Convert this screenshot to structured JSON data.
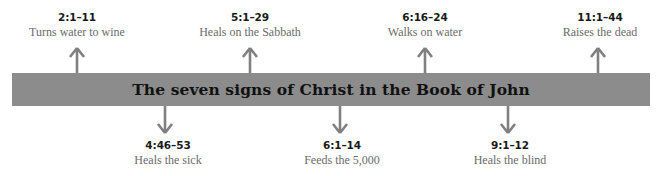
{
  "banner": {
    "title": "The seven signs of Christ in the Book of John",
    "fill_color": "#8c8c8c",
    "text_color": "#111111"
  },
  "arrow_color": "#808080",
  "signs_above": [
    {
      "ref": "2:1–11",
      "desc": "Turns water to wine",
      "x": 77,
      "arrow_x": 77
    },
    {
      "ref": "5:1–29",
      "desc": "Heals on the Sabbath",
      "x": 250,
      "arrow_x": 250
    },
    {
      "ref": "6:16–24",
      "desc": "Walks on water",
      "x": 425,
      "arrow_x": 425
    },
    {
      "ref": "11:1–44",
      "desc": "Raises the dead",
      "x": 600,
      "arrow_x": 598
    }
  ],
  "signs_below": [
    {
      "ref": "4:46–53",
      "desc": "Heals the sick",
      "x": 168,
      "arrow_x": 165
    },
    {
      "ref": "6:1–14",
      "desc": "Feeds the 5,000",
      "x": 342,
      "arrow_x": 340
    },
    {
      "ref": "9:1–12",
      "desc": "Heals the blind",
      "x": 510,
      "arrow_x": 508
    }
  ]
}
